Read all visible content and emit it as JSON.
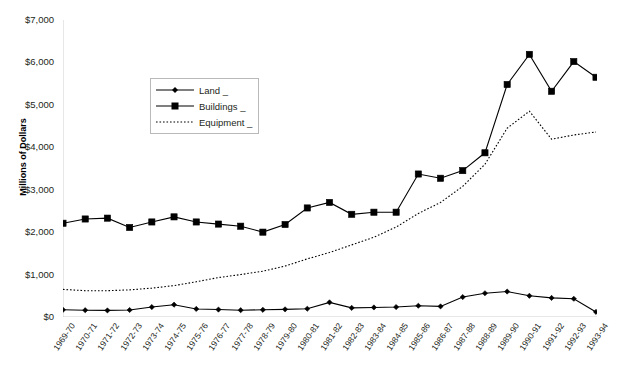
{
  "chart_data": {
    "type": "line",
    "title": "",
    "xlabel": "",
    "ylabel": "Millions of Dollars",
    "ylim": [
      0,
      7000
    ],
    "ytick_values": [
      0,
      1000,
      2000,
      3000,
      4000,
      5000,
      6000,
      7000
    ],
    "ytick_labels": [
      "$0",
      "$1,000",
      "$2,000",
      "$3,000",
      "$4,000",
      "$5,000",
      "$6,000",
      "$7,000"
    ],
    "grid": false,
    "legend_position": "upper-left-inside",
    "categories": [
      "1969-70",
      "1970-71",
      "1971-72",
      "1972-73",
      "1973-74",
      "1974-75",
      "1975-76",
      "1976-77",
      "1977-78",
      "1978-79",
      "1979-80",
      "1980-81",
      "1981-82",
      "1982-83",
      "1983-84",
      "1984-85",
      "1985-86",
      "1986-87",
      "1987-88",
      "1988-89",
      "1989-90",
      "1990-91",
      "1991-92",
      "1992-93",
      "1993-94"
    ],
    "series": [
      {
        "name": "Land _",
        "marker": "diamond",
        "line_style": "solid",
        "color": "#000000",
        "values": [
          170,
          160,
          155,
          165,
          235,
          290,
          190,
          175,
          160,
          170,
          180,
          195,
          345,
          215,
          225,
          235,
          265,
          250,
          470,
          560,
          600,
          500,
          450,
          430,
          120
        ]
      },
      {
        "name": "Buildings _",
        "marker": "square",
        "line_style": "solid",
        "color": "#000000",
        "values": [
          2210,
          2310,
          2330,
          2110,
          2240,
          2360,
          2240,
          2190,
          2140,
          2000,
          2180,
          2570,
          2700,
          2420,
          2470,
          2470,
          3370,
          3270,
          3450,
          3870,
          5480,
          6190,
          5320,
          6020,
          5650
        ]
      },
      {
        "name": "Equipment _",
        "marker": "none",
        "line_style": "dotted",
        "color": "#000000",
        "values": [
          650,
          620,
          620,
          640,
          680,
          740,
          830,
          930,
          1000,
          1080,
          1200,
          1370,
          1520,
          1700,
          1880,
          2120,
          2440,
          2700,
          3080,
          3600,
          4450,
          4850,
          4190,
          4290,
          4360
        ]
      }
    ]
  },
  "legend": {
    "items": [
      {
        "label": "Land _",
        "marker": "diamond",
        "style": "solid"
      },
      {
        "label": "Buildings _",
        "marker": "square",
        "style": "solid"
      },
      {
        "label": "Equipment _",
        "marker": "none",
        "style": "dotted"
      }
    ]
  },
  "axis": {
    "y_title": "Millions of Dollars"
  }
}
